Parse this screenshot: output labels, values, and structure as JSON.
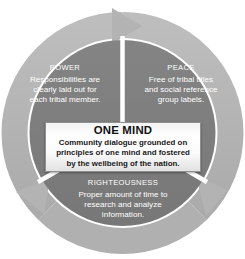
{
  "diagram": {
    "type": "cyclical-process-diagram",
    "colors": {
      "outer_ring": "#b3b3b3",
      "inner_disc": "#7d7d7d",
      "segment_divider": "#ffffff",
      "segment_text": "#ffffff",
      "center_box_border": "#909090",
      "center_box_fill": "#ffffff",
      "center_text": "#111111",
      "page_background": "#ffffff"
    },
    "segments": [
      {
        "id": "power",
        "title": "POWER",
        "lines": [
          "Responsibilities are",
          "clearly laid out for",
          "each tribal member."
        ]
      },
      {
        "id": "peace",
        "title": "PEACE",
        "lines": [
          "Free of tribal titles",
          "and social reference",
          "group labels."
        ]
      },
      {
        "id": "righteousness",
        "title": "RIGHTEOUSNESS",
        "lines": [
          "Proper amount of time to",
          "research and analyze",
          "information."
        ]
      }
    ],
    "center": {
      "title": "ONE MIND",
      "lines": [
        "Community dialogue grounded on",
        "principles of one mind and fostered",
        "by the wellbeing of the nation."
      ]
    },
    "arrows": [
      {
        "id": "arrow-top",
        "direction": "clockwise-top"
      },
      {
        "id": "arrow-lower-right",
        "direction": "clockwise-lower-right"
      },
      {
        "id": "arrow-lower-left",
        "direction": "clockwise-lower-left"
      }
    ]
  }
}
